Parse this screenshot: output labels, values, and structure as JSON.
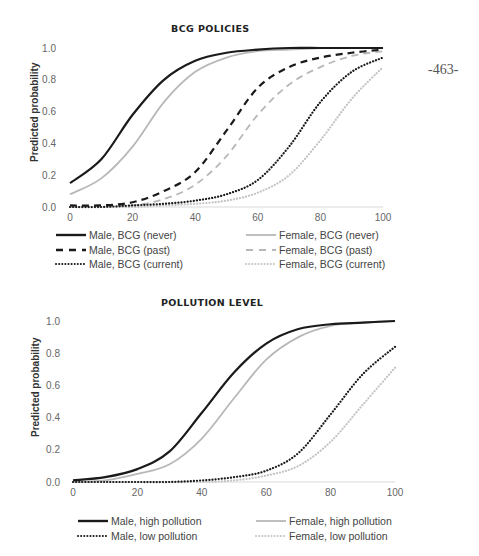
{
  "page_number": "-463-",
  "chart_data": [
    {
      "type": "line",
      "title": "BCG POLICIES",
      "xlabel": "",
      "ylabel": "Predicted probability",
      "xlim": [
        0,
        100
      ],
      "ylim": [
        0,
        1.0
      ],
      "x_ticks": [
        "0",
        "20",
        "40",
        "60",
        "80",
        "100"
      ],
      "y_ticks": [
        "0.0",
        "0.2",
        "0.4",
        "0.6",
        "0.8",
        "1.0"
      ],
      "grid": false,
      "legend_position": "bottom",
      "x": [
        0,
        10,
        20,
        30,
        40,
        50,
        60,
        70,
        80,
        90,
        100
      ],
      "series": [
        {
          "name": "Male, BCG (never)",
          "color": "#1a1a1a",
          "style": "solid",
          "values": [
            0.15,
            0.3,
            0.58,
            0.8,
            0.92,
            0.97,
            0.99,
            1.0,
            1.0,
            1.0,
            1.0
          ]
        },
        {
          "name": "Male, BCG (past)",
          "color": "#1a1a1a",
          "style": "dashed",
          "values": [
            0.01,
            0.01,
            0.03,
            0.1,
            0.22,
            0.48,
            0.75,
            0.88,
            0.94,
            0.97,
            0.99
          ]
        },
        {
          "name": "Male, BCG (current)",
          "color": "#1a1a1a",
          "style": "dotted",
          "values": [
            0.0,
            0.0,
            0.01,
            0.02,
            0.04,
            0.08,
            0.17,
            0.38,
            0.66,
            0.85,
            0.94
          ]
        },
        {
          "name": "Female, BCG (never)",
          "color": "#b8b8b8",
          "style": "solid",
          "values": [
            0.08,
            0.18,
            0.38,
            0.66,
            0.85,
            0.94,
            0.98,
            0.99,
            1.0,
            1.0,
            1.0
          ]
        },
        {
          "name": "Female, BCG (past)",
          "color": "#b8b8b8",
          "style": "dashed",
          "values": [
            0.0,
            0.01,
            0.01,
            0.05,
            0.14,
            0.32,
            0.58,
            0.77,
            0.88,
            0.95,
            0.98
          ]
        },
        {
          "name": "Female, BCG (current)",
          "color": "#c4c4c4",
          "style": "dotted",
          "values": [
            0.0,
            0.0,
            0.0,
            0.01,
            0.02,
            0.04,
            0.09,
            0.2,
            0.42,
            0.68,
            0.88
          ]
        }
      ]
    },
    {
      "type": "line",
      "title": "POLLUTION LEVEL",
      "xlabel": "",
      "ylabel": "Predicted probability",
      "xlim": [
        0,
        100
      ],
      "ylim": [
        0,
        1.0
      ],
      "x_ticks": [
        "0",
        "20",
        "40",
        "60",
        "80",
        "100"
      ],
      "y_ticks": [
        "0.0",
        "0.2",
        "0.4",
        "0.6",
        "0.8",
        "1.0"
      ],
      "grid": false,
      "legend_position": "bottom",
      "x": [
        0,
        10,
        20,
        30,
        40,
        50,
        60,
        70,
        80,
        90,
        100
      ],
      "series": [
        {
          "name": "Male, high pollution",
          "color": "#1a1a1a",
          "style": "solid",
          "values": [
            0.01,
            0.03,
            0.08,
            0.19,
            0.43,
            0.68,
            0.86,
            0.95,
            0.98,
            0.99,
            1.0
          ]
        },
        {
          "name": "Male, low pollution",
          "color": "#1a1a1a",
          "style": "dotted",
          "values": [
            0.0,
            0.0,
            0.0,
            0.0,
            0.01,
            0.03,
            0.07,
            0.18,
            0.42,
            0.67,
            0.84
          ]
        },
        {
          "name": "Female, high pollution",
          "color": "#b8b8b8",
          "style": "solid",
          "values": [
            0.0,
            0.01,
            0.05,
            0.11,
            0.27,
            0.52,
            0.76,
            0.9,
            0.97,
            0.99,
            1.0
          ]
        },
        {
          "name": "Female, low pollution",
          "color": "#c4c4c4",
          "style": "dotted",
          "values": [
            0.0,
            0.0,
            0.0,
            0.0,
            0.0,
            0.01,
            0.04,
            0.1,
            0.25,
            0.48,
            0.71
          ]
        }
      ]
    }
  ]
}
